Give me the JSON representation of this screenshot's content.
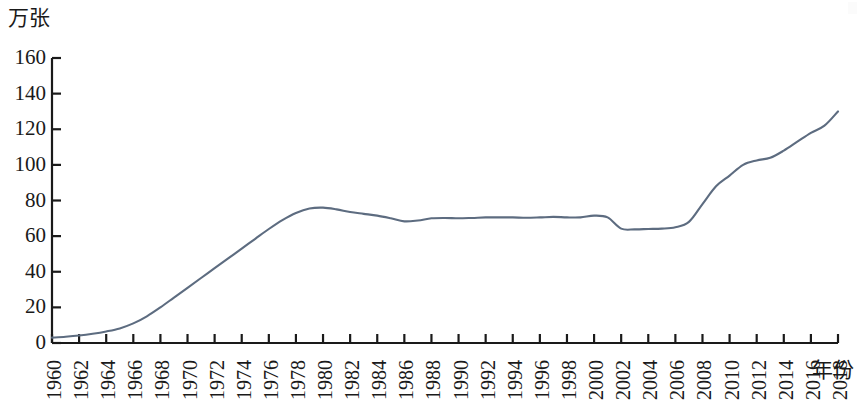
{
  "chart_data": {
    "type": "line",
    "title": "",
    "subtitle": "",
    "xlabel": "年份",
    "ylabel": "万张",
    "xlim": [
      1960,
      2018
    ],
    "ylim": [
      0,
      160
    ],
    "y_ticks": [
      0,
      20,
      40,
      60,
      80,
      100,
      120,
      140,
      160
    ],
    "x_ticks": [
      1960,
      1962,
      1964,
      1966,
      1968,
      1970,
      1972,
      1974,
      1976,
      1978,
      1980,
      1982,
      1984,
      1986,
      1988,
      1990,
      1992,
      1994,
      1996,
      1998,
      2000,
      2002,
      2004,
      2006,
      2008,
      2010,
      2012,
      2014,
      2016,
      2018
    ],
    "x_tick_labels": [
      "1960",
      "1962",
      "1964",
      "1966",
      "1968",
      "1970",
      "1972",
      "1974",
      "1976",
      "1978",
      "1980",
      "1982",
      "1984",
      "1986",
      "1988",
      "1990",
      "1992",
      "1994",
      "1996",
      "1998",
      "2000",
      "2002",
      "2004",
      "2006",
      "2008",
      "2010",
      "2012",
      "2014",
      "2016",
      "2018"
    ],
    "y_tick_labels": [
      "0",
      "20",
      "40",
      "60",
      "80",
      "100",
      "120",
      "140",
      "160"
    ],
    "grid": false,
    "legend": null,
    "legend_position": "none",
    "line_color": "#5d6c80",
    "axis_color": "#1a1a1a",
    "x": [
      1960,
      1961,
      1962,
      1963,
      1964,
      1965,
      1966,
      1967,
      1968,
      1969,
      1970,
      1971,
      1972,
      1973,
      1974,
      1975,
      1976,
      1977,
      1978,
      1979,
      1980,
      1981,
      1982,
      1983,
      1984,
      1985,
      1986,
      1987,
      1988,
      1989,
      1990,
      1991,
      1992,
      1993,
      1994,
      1995,
      1996,
      1997,
      1998,
      1999,
      2000,
      2001,
      2002,
      2003,
      2004,
      2005,
      2006,
      2007,
      2008,
      2009,
      2010,
      2011,
      2012,
      2013,
      2014,
      2015,
      2016,
      2017,
      2018
    ],
    "values": [
      3,
      3.5,
      4.2,
      5.2,
      6.5,
      8.2,
      11,
      15,
      20,
      25.5,
      31,
      36.5,
      42,
      47.5,
      53,
      58.5,
      64,
      69,
      73,
      75.5,
      76,
      75,
      73.5,
      72.5,
      71.5,
      70,
      68.3,
      68.8,
      70,
      70.2,
      70,
      70.2,
      70.5,
      70.5,
      70.5,
      70.3,
      70.5,
      70.8,
      70.5,
      70.5,
      71.5,
      70.5,
      64.2,
      63.8,
      64,
      64.2,
      65,
      68,
      78,
      88,
      94,
      100,
      102.5,
      104,
      108,
      113,
      118,
      122,
      130
    ],
    "units": "万张"
  }
}
